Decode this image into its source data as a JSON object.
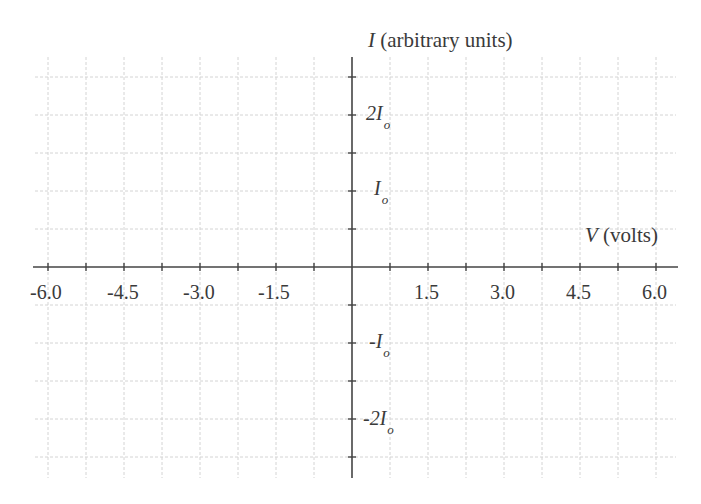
{
  "chart_data": {
    "type": "line",
    "title": "",
    "xlabel": "V (volts)",
    "ylabel": "I (arbitrary units)",
    "x_axis": {
      "var": "V",
      "units": "(volts)",
      "min": -6.0,
      "max": 6.0,
      "grid_step": 0.75,
      "tick_labels": [
        "-6.0",
        "-4.5",
        "-3.0",
        "-1.5",
        "1.5",
        "3.0",
        "4.5",
        "6.0"
      ]
    },
    "y_axis": {
      "var": "I",
      "units": "(arbitrary units)",
      "min": "-2.5Io",
      "max": "2.5Io",
      "grid_step": "0.5Io",
      "tick_labels": [
        {
          "num": "2I",
          "sub": "o"
        },
        {
          "num": "I",
          "sub": "o"
        },
        {
          "num": "-I",
          "sub": "o"
        },
        {
          "num": "-2I",
          "sub": "o"
        }
      ]
    },
    "grid": true,
    "series": [],
    "colors": {
      "axis": "#444444",
      "grid": "#cfcfcf",
      "text": "#3a3a3a"
    }
  }
}
